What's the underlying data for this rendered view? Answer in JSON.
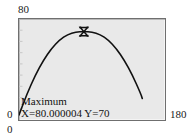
{
  "chart_data": {
    "type": "line",
    "title": "",
    "xlabel": "",
    "ylabel": "",
    "xlim": [
      0,
      180
    ],
    "ylim": [
      0,
      80
    ],
    "grid": false,
    "legend": "none",
    "curve_description": "downward-opening parabola peaking at x=80, y=70",
    "x": [
      0,
      10,
      20,
      30,
      40,
      50,
      60,
      70,
      80,
      90,
      100,
      110,
      120,
      130,
      140,
      150,
      152
    ],
    "values": [
      4.06,
      20.94,
      35.31,
      47.19,
      56.56,
      63.44,
      67.81,
      69.69,
      70.0,
      69.69,
      67.81,
      63.44,
      56.56,
      47.19,
      35.31,
      20.94,
      17.04
    ],
    "marker": {
      "name": "maximum-cursor",
      "shape": "hourglass",
      "x": 80,
      "y": 70
    },
    "annotation": {
      "title": "Maximum",
      "readout": "X=80.000004 Y=70"
    },
    "axis_ticks": {
      "y_max": "80",
      "y_min": "0",
      "x_min": "0",
      "x_max": "180"
    },
    "colors": {
      "curve": "#111111",
      "plot_background": "#e9e9e9",
      "frame_border": "#6f6f6f",
      "page_background": "#ffffff",
      "text": "#1a1a1a"
    }
  }
}
